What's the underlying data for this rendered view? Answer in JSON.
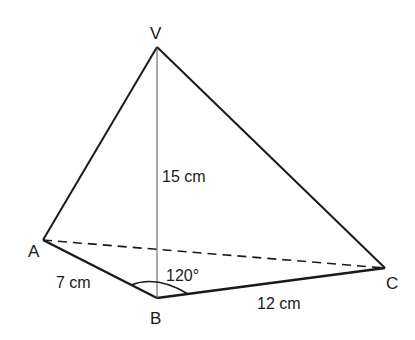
{
  "diagram": {
    "type": "pyramid-geometry",
    "vertices": {
      "V": {
        "label": "V",
        "x": 157,
        "y": 47
      },
      "A": {
        "label": "A",
        "x": 43,
        "y": 240
      },
      "B": {
        "label": "B",
        "x": 157,
        "y": 298
      },
      "C": {
        "label": "C",
        "x": 385,
        "y": 268
      }
    },
    "measurements": {
      "AB": "7 cm",
      "BC": "12 cm",
      "VB": "15 cm",
      "angle_ABC": "120°"
    },
    "colors": {
      "line": "#1a1a1a",
      "height_line": "#555555",
      "background": "#ffffff"
    }
  }
}
